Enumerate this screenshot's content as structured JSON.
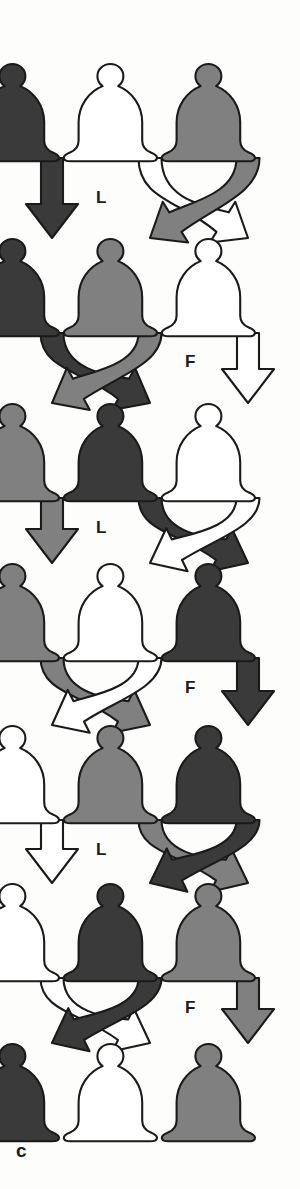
{
  "figure": {
    "panel_label": "c",
    "columns": 3,
    "rows": 7,
    "colors": {
      "dark": "#3a3a3a",
      "gray": "#808080",
      "white": "#ffffff",
      "outline": "#1a1a1a",
      "background": "#fdfdfc"
    },
    "column_x": [
      52,
      150,
      248
    ],
    "row_y": [
      110,
      285,
      450,
      610,
      772,
      930,
      1090
    ],
    "bell_rows": [
      {
        "index": 1,
        "cells": [
          "dark",
          "white",
          "gray"
        ]
      },
      {
        "index": 2,
        "cells": [
          "dark",
          "gray",
          "white"
        ]
      },
      {
        "index": 3,
        "cells": [
          "gray",
          "dark",
          "white"
        ]
      },
      {
        "index": 4,
        "cells": [
          "gray",
          "white",
          "dark"
        ]
      },
      {
        "index": 5,
        "cells": [
          "white",
          "gray",
          "dark"
        ]
      },
      {
        "index": 6,
        "cells": [
          "white",
          "dark",
          "gray"
        ]
      },
      {
        "index": 7,
        "cells": [
          "dark",
          "white",
          "gray"
        ]
      }
    ],
    "transitions": [
      {
        "from_row": 1,
        "to_row": 2,
        "operation": "L",
        "label": "L",
        "label_x": 96,
        "label_y": 188,
        "moves": [
          {
            "from_col": 1,
            "to_col": 1,
            "kind": "straight",
            "color": "dark"
          },
          {
            "from_col": 2,
            "to_col": 3,
            "kind": "cross",
            "color": "white"
          },
          {
            "from_col": 3,
            "to_col": 2,
            "kind": "cross",
            "color": "gray"
          }
        ]
      },
      {
        "from_row": 2,
        "to_row": 3,
        "operation": "F",
        "label": "F",
        "label_x": 185,
        "label_y": 352,
        "moves": [
          {
            "from_col": 1,
            "to_col": 2,
            "kind": "cross",
            "color": "dark"
          },
          {
            "from_col": 2,
            "to_col": 1,
            "kind": "cross",
            "color": "gray"
          },
          {
            "from_col": 3,
            "to_col": 3,
            "kind": "straight",
            "color": "white"
          }
        ]
      },
      {
        "from_row": 3,
        "to_row": 4,
        "operation": "L",
        "label": "L",
        "label_x": 96,
        "label_y": 518,
        "moves": [
          {
            "from_col": 1,
            "to_col": 1,
            "kind": "straight",
            "color": "gray"
          },
          {
            "from_col": 2,
            "to_col": 3,
            "kind": "cross",
            "color": "dark"
          },
          {
            "from_col": 3,
            "to_col": 2,
            "kind": "cross",
            "color": "white"
          }
        ]
      },
      {
        "from_row": 4,
        "to_row": 5,
        "operation": "F",
        "label": "F",
        "label_x": 185,
        "label_y": 678,
        "moves": [
          {
            "from_col": 1,
            "to_col": 2,
            "kind": "cross",
            "color": "gray"
          },
          {
            "from_col": 2,
            "to_col": 1,
            "kind": "cross",
            "color": "white"
          },
          {
            "from_col": 3,
            "to_col": 3,
            "kind": "straight",
            "color": "dark"
          }
        ]
      },
      {
        "from_row": 5,
        "to_row": 6,
        "operation": "L",
        "label": "L",
        "label_x": 96,
        "label_y": 840,
        "moves": [
          {
            "from_col": 1,
            "to_col": 1,
            "kind": "straight",
            "color": "white"
          },
          {
            "from_col": 2,
            "to_col": 3,
            "kind": "cross",
            "color": "gray"
          },
          {
            "from_col": 3,
            "to_col": 2,
            "kind": "cross",
            "color": "dark"
          }
        ]
      },
      {
        "from_row": 6,
        "to_row": 7,
        "operation": "F",
        "label": "F",
        "label_x": 185,
        "label_y": 998,
        "moves": [
          {
            "from_col": 1,
            "to_col": 2,
            "kind": "cross",
            "color": "white"
          },
          {
            "from_col": 2,
            "to_col": 1,
            "kind": "cross",
            "color": "dark"
          },
          {
            "from_col": 3,
            "to_col": 3,
            "kind": "straight",
            "color": "gray"
          }
        ]
      }
    ]
  }
}
